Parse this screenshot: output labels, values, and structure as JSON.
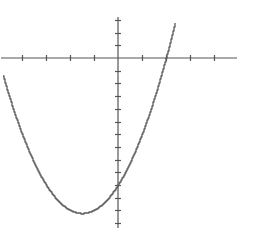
{
  "chart_data": {
    "type": "line",
    "title": "",
    "xlabel": "",
    "ylabel": "",
    "function": "y = x^2 + 3x - 10",
    "xlim": [
      -4.9,
      4.9
    ],
    "ylim": [
      -13,
      3.2
    ],
    "x_ticks": [
      -5,
      -4,
      -3,
      -2,
      -1,
      1,
      2,
      3,
      4
    ],
    "y_ticks": [
      3,
      2,
      1,
      -1,
      -2,
      -3,
      -4,
      -5,
      -6,
      -7,
      -8,
      -9,
      -10,
      -11,
      -12,
      -13
    ],
    "grid": false,
    "legend": null,
    "roots": [
      -5,
      2
    ],
    "y_intercept": -10,
    "vertex": {
      "x": -1.5,
      "y": -12.25
    },
    "series": [
      {
        "name": "parabola",
        "x": [
          -4.9,
          -4.5,
          -4,
          -3.5,
          -3,
          -2.5,
          -2,
          -1.5,
          -1,
          -0.5,
          0,
          0.5,
          1,
          1.5,
          2,
          2.4
        ],
        "values": [
          -0.49,
          -2.25,
          -4,
          -5.25,
          -6,
          -6.25,
          -6,
          -12.25,
          -12,
          -11.25,
          -10,
          -8.25,
          -6,
          -3.75,
          0,
          2.96
        ]
      }
    ]
  },
  "layout": {
    "origin_px": [
      118,
      58
    ],
    "x_unit_px": 24,
    "y_unit_px": 12.7,
    "x_axis_px": [
      1,
      237
    ],
    "y_axis_px": [
      17,
      228
    ]
  }
}
